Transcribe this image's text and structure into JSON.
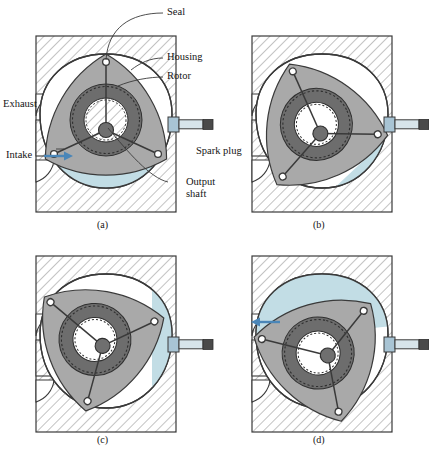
{
  "figure": {
    "type": "technical-cutaway-diagram",
    "panel_count": 4
  },
  "labels": {
    "seal": "Seal",
    "housing": "Housing",
    "rotor": "Rotor",
    "exhaust": "Exhaust",
    "intake": "Intake",
    "spark_plug": "Spark plug",
    "output_shaft_line1": "Output",
    "output_shaft_line2": "shaft"
  },
  "captions": {
    "a": "(a)",
    "b": "(b)",
    "c": "(c)",
    "d": "(d)"
  },
  "panels": [
    {
      "id": "a",
      "caption": "(a)",
      "stage": "intake",
      "rotor_rotation_deg": 0,
      "gas_chamber": "bottom",
      "gas_color": "#c2dde5",
      "arrow": "intake-right"
    },
    {
      "id": "b",
      "caption": "(b)",
      "stage": "compression",
      "rotor_rotation_deg": -22,
      "gas_chamber": "lower-right",
      "gas_color": "#c2dde5",
      "arrow": "none"
    },
    {
      "id": "c",
      "caption": "(c)",
      "stage": "ignition-power",
      "rotor_rotation_deg": -48,
      "gas_chamber": "right-sliver",
      "gas_color": "#c2dde5",
      "arrow": "none"
    },
    {
      "id": "d",
      "caption": "(d)",
      "stage": "exhaust",
      "rotor_rotation_deg": -75,
      "gas_chamber": "top",
      "gas_color": "#c2dde5",
      "arrow": "exhaust-left"
    }
  ],
  "colors": {
    "gas": "#c2dde5",
    "gas_edge": "#8fb9c6",
    "rotor_face": "#a9a9a9",
    "rotor_face_light": "#bdbdbd",
    "ring_gear": "#6d6d6d",
    "hub": "#6f6f6f",
    "hatch_line": "#b4b4b4",
    "outline": "#3a3a3a",
    "spark_body": "#a8c4d4",
    "spark_shaft": "#d7e4ea",
    "spark_tip": "#4a4a4a",
    "arrow": "#4a86b8",
    "background": "#ffffff"
  },
  "icons": {
    "intake_arrow": "arrow-right-icon",
    "exhaust_arrow": "arrow-left-icon"
  }
}
